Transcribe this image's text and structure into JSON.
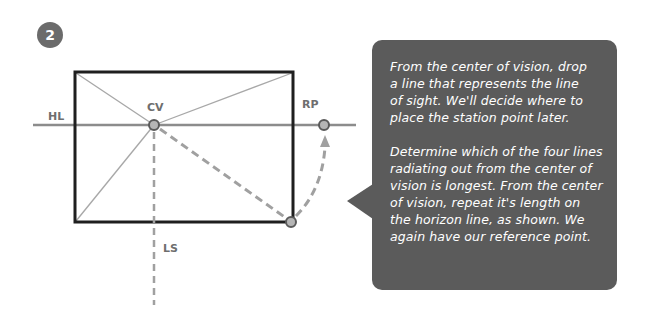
{
  "step": {
    "number": "2",
    "color": "#6b6b6b"
  },
  "labels": {
    "horizon_line": "HL",
    "center_of_vision": "CV",
    "reference_point": "RP",
    "line_of_sight": "LS"
  },
  "colors": {
    "bubble": "#5b5b5b",
    "frame": "#1f1f1f",
    "guide": "#a8a8a8",
    "horizon": "#8c8c8c",
    "dash": "#a0a0a0",
    "point_fill": "#b5b5b5",
    "point_stroke": "#5a5a5a"
  },
  "bubble": {
    "paragraphs": [
      "From the center of vision, drop\na line that represents the line\nof sight. We'll decide where to\nplace the station point later.",
      "Determine which of the four lines\nradiating out from the center of\nvision is longest. From the center\nof vision, repeat it's length on\nthe horizon line, as shown. We\nagain have our reference point."
    ]
  }
}
